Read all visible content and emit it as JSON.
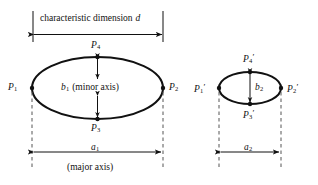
{
  "figure": {
    "title_top": "characteristic dimension",
    "title_top_symbol": "d",
    "background": "#ffffff",
    "ink": "#111111"
  },
  "left_ellipse": {
    "name": "ellipse-1",
    "points": {
      "p1": {
        "letter": "P",
        "sub": "1",
        "prime": ""
      },
      "p2": {
        "letter": "P",
        "sub": "2",
        "prime": ""
      },
      "p3": {
        "letter": "P",
        "sub": "3",
        "prime": ""
      },
      "p4": {
        "letter": "P",
        "sub": "4",
        "prime": ""
      }
    },
    "minor_axis": {
      "letter": "b",
      "sub": "1",
      "text": "(minor axis)"
    },
    "major_axis": {
      "letter": "a",
      "sub": "1",
      "text": "(major axis)"
    }
  },
  "right_ellipse": {
    "name": "ellipse-2",
    "points": {
      "p1": {
        "letter": "P",
        "sub": "1",
        "prime": "′"
      },
      "p2": {
        "letter": "P",
        "sub": "2",
        "prime": "′"
      },
      "p3": {
        "letter": "P",
        "sub": "3",
        "prime": "′"
      },
      "p4": {
        "letter": "P",
        "sub": "4",
        "prime": "′"
      }
    },
    "minor_axis": {
      "letter": "b",
      "sub": "2",
      "text": ""
    },
    "major_axis": {
      "letter": "a",
      "sub": "2",
      "text": ""
    }
  }
}
